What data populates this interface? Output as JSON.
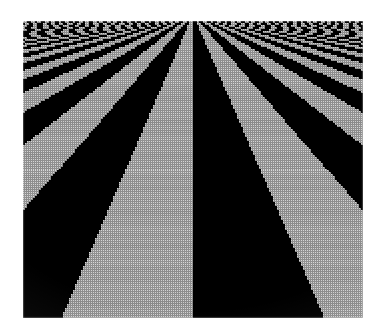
{
  "page": {
    "background_color": "#ffffff",
    "width": 380,
    "height": 335,
    "caption": ""
  },
  "figure": {
    "name": "perspective-checkerboard",
    "title": "",
    "frame": {
      "x": 23,
      "y": 21,
      "width": 340,
      "height": 297
    },
    "background_color": "#ffffff"
  },
  "chart_data": {
    "type": "heatmap",
    "title": "",
    "subtitle": "",
    "xlabel": "",
    "ylabel": "",
    "projection": {
      "kind": "perspective",
      "vanishing_point_x": 193,
      "vanishing_point_y": 14,
      "horizon_y_in_frame": -7,
      "center_seam_x": 193,
      "eye_height": 1.0,
      "focal_length": 1.0
    },
    "texture": {
      "pattern": "checkerboard",
      "square_world_size": 1.0,
      "colors": [
        "#000000",
        "#d2d2d2"
      ],
      "dark_color": "#000000",
      "light_color": "#d2d2d2",
      "gridline_color": "#9a9a9a",
      "gridline_on_light_only": true
    },
    "display_grid": {
      "visible": true,
      "pixel_pitch_px": 2,
      "cols": 170,
      "rows": 149,
      "line_color": "#8e8e8e",
      "line_alpha": 0.45
    },
    "sampling": {
      "filter": "none",
      "method": "point-sample",
      "aliasing_visible": true,
      "aliasing_zone_rows": [
        0,
        34
      ]
    },
    "axis_ranges": {
      "screen_x": [
        0,
        340
      ],
      "screen_y": [
        0,
        297
      ]
    },
    "grid": true,
    "legend": {
      "visible": false,
      "position": "none"
    },
    "annotations": []
  }
}
